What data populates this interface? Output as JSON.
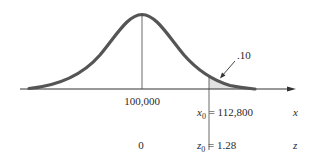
{
  "diagram": {
    "type": "normal-distribution",
    "mean_label": "100,000",
    "z_mean_label": "0",
    "x0_label": "x",
    "x0_sub": "0",
    "x0_value": " = 112,800",
    "z0_label": "z",
    "z0_sub": "0",
    "z0_value": " = 1.28",
    "x_axis_label": "x",
    "z_axis_label": "z",
    "tail_area_label": ".10",
    "colors": {
      "curve": "#555555",
      "axis": "#333333",
      "shade": "#e2e2e2",
      "text": "#2a2a2a"
    }
  }
}
